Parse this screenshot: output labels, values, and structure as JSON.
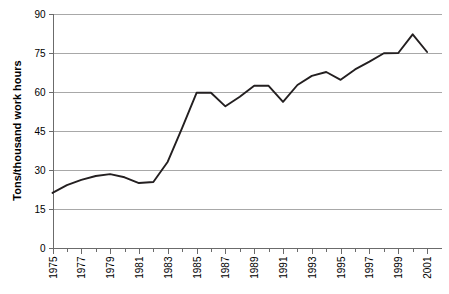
{
  "chart_data": {
    "type": "line",
    "title": "",
    "xlabel": "",
    "ylabel": "Tons/thousand work hours",
    "ylim": [
      0,
      90
    ],
    "xlim": [
      1975,
      2002
    ],
    "yticks": [
      0,
      15,
      30,
      45,
      60,
      75,
      90
    ],
    "ytick_labels": [
      "0",
      "15",
      "30",
      "45",
      "60",
      "75",
      "90"
    ],
    "xticks": [
      1975,
      1976,
      1977,
      1978,
      1979,
      1980,
      1981,
      1982,
      1983,
      1984,
      1985,
      1986,
      1987,
      1988,
      1989,
      1990,
      1991,
      1992,
      1993,
      1994,
      1995,
      1996,
      1997,
      1998,
      1999,
      2000,
      2001
    ],
    "xtick_labels": [
      "1975",
      "",
      "1977",
      "",
      "1979",
      "",
      "1981",
      "",
      "1983",
      "",
      "1985",
      "",
      "1987",
      "",
      "1989",
      "",
      "1991",
      "",
      "1993",
      "",
      "1995",
      "",
      "1997",
      "",
      "1999",
      "",
      "2001"
    ],
    "grid": true,
    "grid_axis": "y",
    "legend": false,
    "legend_position": "none",
    "line_color": "#231f20",
    "grid_color": "#a8a8a8",
    "axis_color": "#6b6b6b",
    "x": [
      1975,
      1976,
      1977,
      1978,
      1979,
      1980,
      1981,
      1982,
      1983,
      1984,
      1985,
      1986,
      1987,
      1988,
      1989,
      1990,
      1991,
      1992,
      1993,
      1994,
      1995,
      1996,
      1997,
      1998,
      1999,
      2000,
      2001
    ],
    "values": [
      21.0,
      24.0,
      26.0,
      27.5,
      28.2,
      27.0,
      24.8,
      25.2,
      33.0,
      46.0,
      59.5,
      59.5,
      54.3,
      58.0,
      62.2,
      62.2,
      56.0,
      62.5,
      66.0,
      67.5,
      64.5,
      68.5,
      71.5,
      74.7,
      74.8,
      82.0,
      75.2
    ],
    "series": [
      {
        "name": "Tons per thousand work hours",
        "values": [
          21.0,
          24.0,
          26.0,
          27.5,
          28.2,
          27.0,
          24.8,
          25.2,
          33.0,
          46.0,
          59.5,
          59.5,
          54.3,
          58.0,
          62.2,
          62.2,
          56.0,
          62.5,
          66.0,
          67.5,
          64.5,
          68.5,
          71.5,
          74.7,
          74.8,
          82.0,
          75.2
        ]
      }
    ]
  }
}
